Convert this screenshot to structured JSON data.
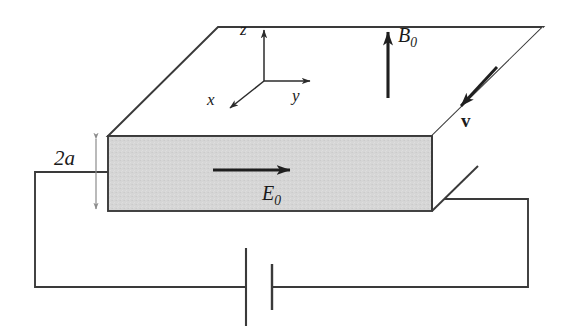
{
  "figure": {
    "background_color": "#ffffff",
    "line_color": "#2b2b2b",
    "slab_fill_color": "#d4d4d4",
    "dimension_arrow_color": "#8c8c8c"
  },
  "axes": {
    "z_label": "z",
    "y_label": "y",
    "x_label": "x"
  },
  "labels": {
    "thickness": "2a",
    "electric_field": "E",
    "electric_field_subscript": "0",
    "magnetic_field": "B",
    "magnetic_field_subscript": "0",
    "velocity": "v"
  },
  "elements": {
    "slab_name": "conducting-slab",
    "battery_name": "battery-symbol",
    "circuit_name": "circuit-wire"
  }
}
